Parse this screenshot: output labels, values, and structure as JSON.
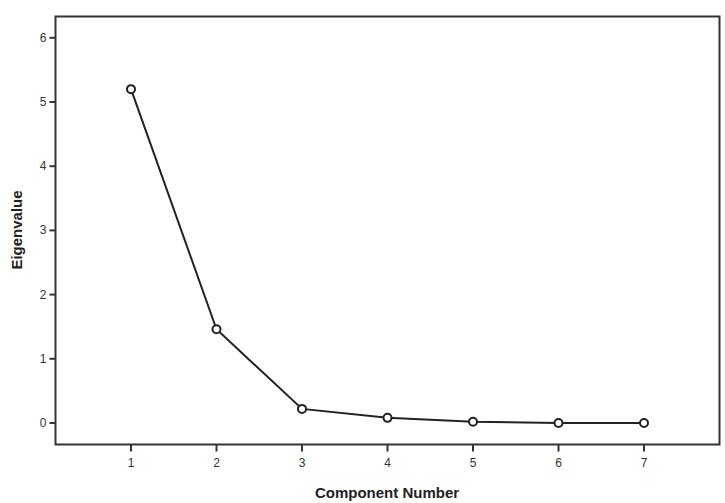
{
  "chart_data": {
    "type": "line",
    "title": "",
    "xlabel": "Component Number",
    "ylabel": "Eigenvalue",
    "x": [
      1,
      2,
      3,
      4,
      5,
      6,
      7
    ],
    "categories": [
      "1",
      "2",
      "3",
      "4",
      "5",
      "6",
      "7"
    ],
    "series": [
      {
        "name": "Eigenvalue",
        "values": [
          5.2,
          1.46,
          0.22,
          0.08,
          0.02,
          0.0,
          0.0
        ]
      }
    ],
    "values": [
      5.2,
      1.46,
      0.22,
      0.08,
      0.02,
      0.0,
      0.0
    ],
    "xlim": [
      0.1,
      7.9
    ],
    "ylim": [
      -0.33,
      6.33
    ],
    "yticks": [
      0,
      1,
      2,
      3,
      4,
      5,
      6
    ],
    "xticks": [
      1,
      2,
      3,
      4,
      5,
      6,
      7
    ],
    "grid": false,
    "legend": null,
    "marker": "open-circle",
    "line_color": "#222222"
  }
}
